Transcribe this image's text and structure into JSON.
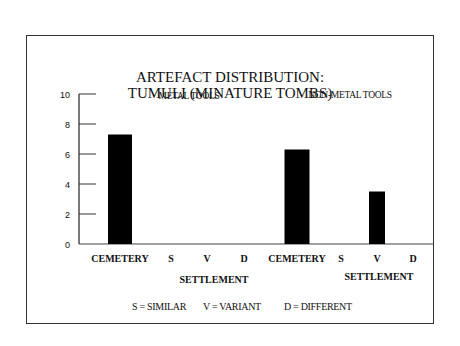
{
  "chart_data": {
    "type": "bar",
    "title": "ARTEFACT DISTRIBUTION:",
    "subtitle": "TUMULI (MINATURE TOMBS)",
    "xlabel": "",
    "ylabel": "",
    "ylim": [
      0,
      10
    ],
    "yticks": [
      "0",
      "2",
      "4",
      "6",
      "8",
      "10"
    ],
    "ytick_values": [
      0,
      2,
      4,
      6,
      8,
      10
    ],
    "grid": false,
    "bar_color": "#000000",
    "panels": [
      {
        "name": "METAL TOOLS",
        "categories": [
          "CEMETERY",
          "S",
          "V",
          "D"
        ],
        "values": [
          7.3,
          0,
          0,
          0
        ],
        "group_label": "SETTLEMENT"
      },
      {
        "name": "NON-METAL TOOLS",
        "categories": [
          "CEMETERY",
          "S",
          "V",
          "D"
        ],
        "values": [
          6.3,
          0,
          3.5,
          0
        ],
        "group_label": "SETTLEMENT"
      }
    ],
    "legend": [
      "S = SIMILAR",
      "V = VARIANT",
      "D = DIFFERENT"
    ],
    "legend_placement": "bottom"
  }
}
